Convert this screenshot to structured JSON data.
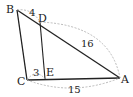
{
  "diagram": {
    "points": {
      "A": {
        "label": "A",
        "x": 120,
        "y": 78
      },
      "B": {
        "label": "B",
        "x": 17,
        "y": 10
      },
      "C": {
        "label": "C",
        "x": 27,
        "y": 80
      },
      "D": {
        "label": "D",
        "x": 40,
        "y": 22
      },
      "E": {
        "label": "E",
        "x": 45,
        "y": 79
      }
    },
    "segments": [
      "AB",
      "BC",
      "CA",
      "DE"
    ],
    "measures": {
      "BD": "4",
      "DA": "16",
      "CE": "3",
      "CA": "15"
    },
    "colors": {
      "line": "#222222",
      "dashed": "#aaaaaa"
    }
  }
}
